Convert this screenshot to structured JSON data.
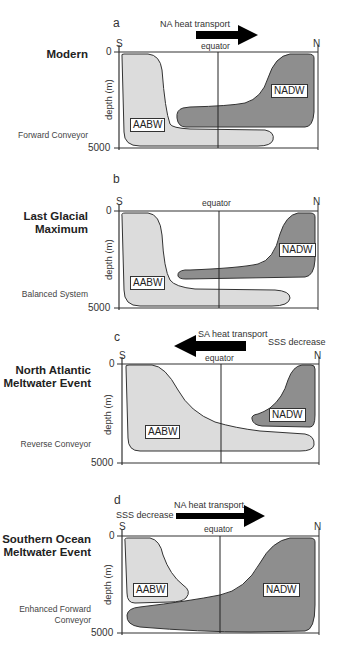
{
  "colors": {
    "aabw_fill": "#dcdcdc",
    "nadw_fill": "#8e8e8e",
    "outline": "#333333",
    "arrow": "#000000"
  },
  "axes": {
    "ylabel": "depth (m)",
    "y_top": "0",
    "y_bottom": "5000",
    "left": "S",
    "right": "N",
    "equator": "equator"
  },
  "panels": [
    {
      "letter": "a",
      "title": "Modern",
      "mode": "Forward Conveyor",
      "arrow": {
        "direction": "right",
        "label": "NA heat transport"
      },
      "water_masses": [
        "AABW",
        "NADW"
      ]
    },
    {
      "letter": "b",
      "title": "Last Glacial Maximum",
      "title_lines": [
        "Last Glacial",
        "Maximum"
      ],
      "mode": "Balanced System",
      "water_masses": [
        "AABW",
        "NADW"
      ]
    },
    {
      "letter": "c",
      "title": "North Atlantic Meltwater Event",
      "title_lines": [
        "North Atlantic",
        "Meltwater Event"
      ],
      "mode": "Reverse Conveyor",
      "arrow": {
        "direction": "left",
        "label": "SA heat transport"
      },
      "annotation": "SSS decrease",
      "water_masses": [
        "AABW",
        "NADW"
      ]
    },
    {
      "letter": "d",
      "title": "Southern Ocean Meltwater Event",
      "title_lines": [
        "Southern Ocean",
        "Meltwater Event"
      ],
      "mode": "Enhanced Forward Conveyor",
      "mode_lines": [
        "Enhanced Forward",
        "Conveyor"
      ],
      "arrow": {
        "direction": "right",
        "label": "NA heat transport"
      },
      "annotation": "SSS decrease",
      "water_masses": [
        "AABW",
        "NADW"
      ]
    }
  ]
}
